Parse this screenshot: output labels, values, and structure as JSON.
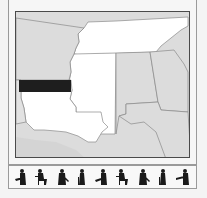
{
  "map": {
    "region": "Southeastern United States",
    "highlight_color": "#1e1e1e",
    "colors": {
      "land": "#dcdcdc",
      "highlighted_states": "#ffffff",
      "border": "#8a8a8a",
      "frame": "#4a4a4a"
    },
    "states": [
      {
        "name": "Arkansas",
        "fill": "land"
      },
      {
        "name": "Tennessee",
        "fill": "highlighted_states"
      },
      {
        "name": "Mississippi",
        "fill": "highlighted_states"
      },
      {
        "name": "Louisiana",
        "fill": "highlighted_states"
      },
      {
        "name": "Alabama",
        "fill": "land"
      },
      {
        "name": "Georgia",
        "fill": "land"
      },
      {
        "name": "Florida",
        "fill": "land"
      }
    ],
    "highlight_band": {
      "label": "selected-region"
    }
  },
  "strip": {
    "musicians": [
      {
        "icon": "guitarist-icon"
      },
      {
        "icon": "drummer-icon"
      },
      {
        "icon": "fiddler-icon"
      },
      {
        "icon": "bassist-icon"
      },
      {
        "icon": "guitarist-icon"
      },
      {
        "icon": "drummer-icon"
      },
      {
        "icon": "fiddler-icon"
      },
      {
        "icon": "bassist-icon"
      },
      {
        "icon": "trumpeter-icon"
      }
    ]
  }
}
